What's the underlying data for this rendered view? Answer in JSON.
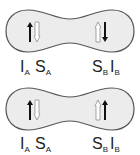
{
  "diagram": {
    "colors": {
      "shape_fill": "#ececec",
      "shape_stroke": "#555555",
      "solid_arrow": "#111111",
      "hollow_arrow": "#999999"
    },
    "panels": [
      {
        "name": "panel-top",
        "left_site": {
          "I_label": "I",
          "I_sub": "A",
          "S_label": "S",
          "S_sub": "A",
          "solid_arrow": "up",
          "hollow_arrow": "down"
        },
        "right_site": {
          "S_label": "S",
          "S_sub": "B",
          "I_label": "I",
          "I_sub": "B",
          "hollow_arrow": "up",
          "solid_arrow": "down"
        }
      },
      {
        "name": "panel-bottom",
        "left_site": {
          "I_label": "I",
          "I_sub": "A",
          "S_label": "S",
          "S_sub": "A",
          "solid_arrow": "up",
          "hollow_arrow": "down"
        },
        "right_site": {
          "S_label": "S",
          "S_sub": "B",
          "I_label": "I",
          "I_sub": "B",
          "hollow_arrow": "up",
          "solid_arrow": "up"
        }
      }
    ]
  }
}
